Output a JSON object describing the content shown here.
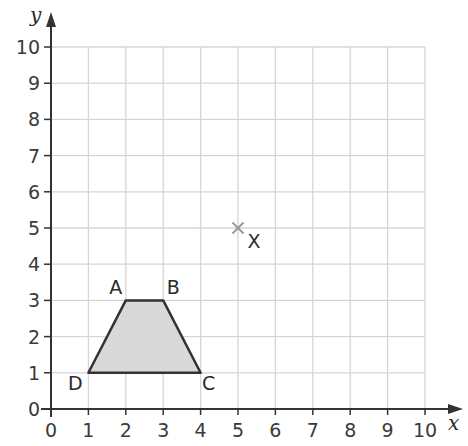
{
  "axes": {
    "x_label": "x",
    "y_label": "y",
    "x_ticks": [
      "0",
      "1",
      "2",
      "3",
      "4",
      "5",
      "6",
      "7",
      "8",
      "9",
      "10"
    ],
    "y_ticks": [
      "0",
      "1",
      "2",
      "3",
      "4",
      "5",
      "6",
      "7",
      "8",
      "9",
      "10"
    ],
    "x_range": [
      0,
      10
    ],
    "y_range": [
      0,
      10
    ]
  },
  "shape": {
    "name": "trapezium ABCD",
    "fill": "#d9d9d9",
    "stroke": "#333333",
    "vertices": [
      {
        "label": "A",
        "x": 2,
        "y": 3
      },
      {
        "label": "B",
        "x": 3,
        "y": 3
      },
      {
        "label": "C",
        "x": 4,
        "y": 1
      },
      {
        "label": "D",
        "x": 1,
        "y": 1
      }
    ]
  },
  "point": {
    "label": "X",
    "x": 5,
    "y": 5,
    "marker": "cross",
    "color": "#999999"
  },
  "colors": {
    "grid": "#d6d6d6",
    "axis": "#333333"
  }
}
